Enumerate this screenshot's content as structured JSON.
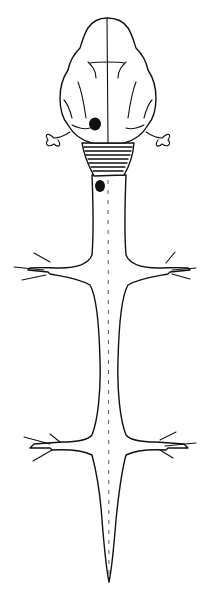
{
  "figure": {
    "parts": [
      "cerebrum",
      "midline fissure",
      "left optic/sensory organ",
      "right optic/sensory organ",
      "hatched hindbrain region",
      "spinal cord",
      "forelimb nerve plexus left",
      "forelimb nerve plexus right",
      "hindlimb nerve plexus left",
      "hindlimb nerve plexus right",
      "tapering tail"
    ],
    "marks": [
      "dark lesion on left cerebrum",
      "dark lesion on upper spinal cord"
    ],
    "colors": {
      "ink": "#111111",
      "background": "#ffffff"
    }
  }
}
